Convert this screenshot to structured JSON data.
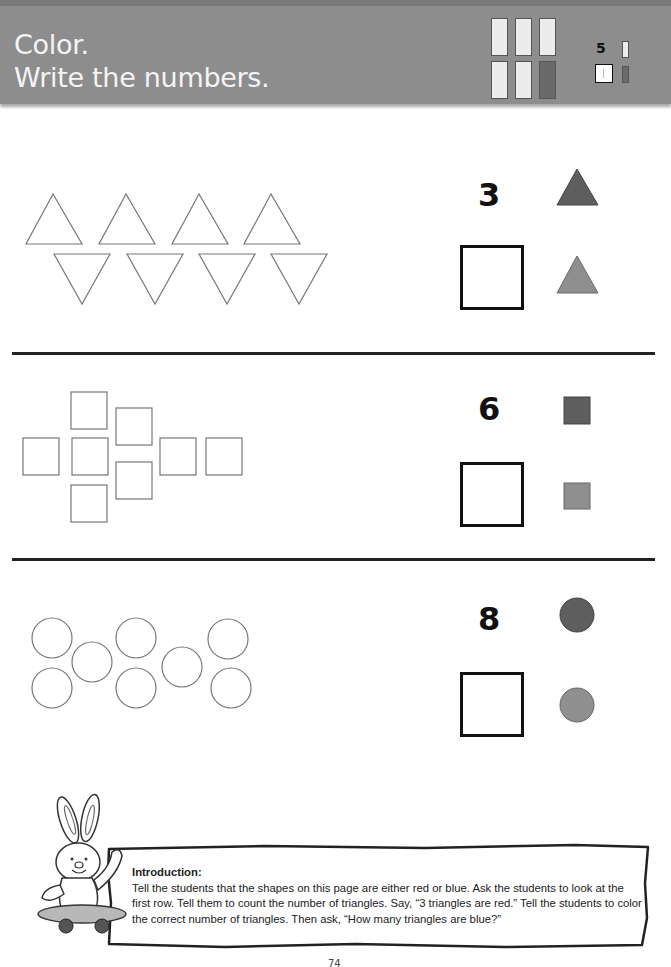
{
  "header": {
    "title_line1": "Color.",
    "title_line2": "Write the numbers.",
    "background_color": "#8d8d8d",
    "legend_bars": [
      {
        "row": "top",
        "colors": [
          "light",
          "light",
          "light"
        ]
      },
      {
        "row": "bottom",
        "colors": [
          "light",
          "light",
          "dark"
        ]
      }
    ],
    "example": {
      "number": "5",
      "answer_box_content": "1",
      "light_bar": "light",
      "dark_bar": "dark"
    }
  },
  "rows": [
    {
      "shape": "triangle",
      "shape_count": 8,
      "arrangement": "4 upward triangles over 4 downward triangles",
      "count_label": "3",
      "key_top": {
        "shape": "triangle",
        "color": "#5e5e5e",
        "meaning": "red"
      },
      "key_bottom": {
        "shape": "triangle",
        "color": "#8f8f8f",
        "meaning": "blue"
      },
      "answer_box": ""
    },
    {
      "shape": "square",
      "shape_count": 9,
      "arrangement": "cross-like cluster of squares",
      "count_label": "6",
      "key_top": {
        "shape": "square",
        "color": "#5e5e5e",
        "meaning": "red"
      },
      "key_bottom": {
        "shape": "square",
        "color": "#8f8f8f",
        "meaning": "blue"
      },
      "answer_box": ""
    },
    {
      "shape": "circle",
      "shape_count": 9,
      "arrangement": "scattered circles in two staggered rows",
      "count_label": "8",
      "key_top": {
        "shape": "circle",
        "color": "#5e5e5e",
        "meaning": "red"
      },
      "key_bottom": {
        "shape": "circle",
        "color": "#8f8f8f",
        "meaning": "blue"
      },
      "answer_box": ""
    }
  ],
  "teacher_note": {
    "mascot": "bunny-on-skateboard",
    "heading": "Introduction:",
    "body": "Tell the students that the shapes on this page are either red or blue. Ask the students to look at the first row. Tell them to count the number of triangles. Say, “3 triangles are red.” Tell the students to color the correct number of triangles. Then ask, “How many triangles are blue?”"
  },
  "page_number": "74"
}
